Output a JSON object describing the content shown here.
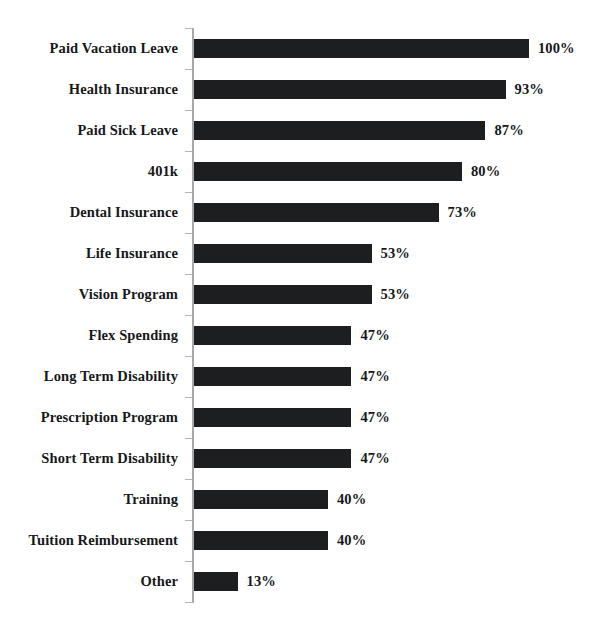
{
  "chart_data": {
    "type": "bar",
    "orientation": "horizontal",
    "title": "",
    "xlabel": "",
    "ylabel": "",
    "xlim": [
      0,
      100
    ],
    "grid": false,
    "legend": false,
    "value_suffix": "%",
    "bar_color": "#1d1e20",
    "axis_color": "#a8a8a8",
    "background": "#ffffff",
    "categories": [
      "Paid Vacation Leave",
      "Health Insurance",
      "Paid Sick Leave",
      "401k",
      "Dental Insurance",
      "Life Insurance",
      "Vision Program",
      "Flex Spending",
      "Long Term Disability",
      "Prescription Program",
      "Short Term Disability",
      "Training",
      "Tuition Reimbursement",
      "Other"
    ],
    "values": [
      100,
      93,
      87,
      80,
      73,
      53,
      53,
      47,
      47,
      47,
      47,
      40,
      40,
      13
    ],
    "value_labels": [
      "100%",
      "93%",
      "87%",
      "80%",
      "73%",
      "53%",
      "53%",
      "47%",
      "47%",
      "47%",
      "47%",
      "40%",
      "40%",
      "13%"
    ]
  }
}
